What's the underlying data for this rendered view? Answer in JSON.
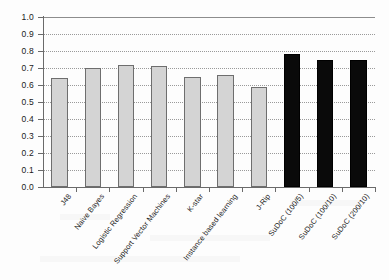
{
  "chart_data": {
    "type": "bar",
    "title": "",
    "subtitle": "",
    "xlabel": "",
    "ylabel": "",
    "categories": [
      "J48",
      "Naive Bayes",
      "Logistic Regression",
      "Support Vector Machines",
      "K-star",
      "Instance based learning",
      "J-Rip",
      "SuDoC (100/5)",
      "SuDoC (100/10)",
      "SuDoC (200/10)"
    ],
    "values": [
      0.64,
      0.7,
      0.72,
      0.71,
      0.65,
      0.66,
      0.59,
      0.78,
      0.75,
      0.75
    ],
    "bar_colors": [
      "#d4d4d4",
      "#d4d4d4",
      "#d4d4d4",
      "#d4d4d4",
      "#d4d4d4",
      "#d4d4d4",
      "#d4d4d4",
      "#0a0a0a",
      "#0a0a0a",
      "#0a0a0a"
    ],
    "ylim": [
      0.0,
      1.0
    ],
    "ytick_labels": [
      "1.0",
      "0.9",
      "0.8",
      "0.7",
      "0.6",
      "0.5",
      "0.4",
      "0.3",
      "0.2",
      "0.1",
      "0.0"
    ],
    "ytick_values": [
      1.0,
      0.9,
      0.8,
      0.7,
      0.6,
      0.5,
      0.4,
      0.3,
      0.2,
      0.1,
      0.0
    ],
    "grid": true,
    "grid_axis": "y",
    "legend": null,
    "legend_position": "none",
    "annotations": []
  },
  "colors": {
    "gray_bar": "#d4d4d4",
    "black_bar": "#0a0a0a",
    "bar_outline": "#6e6e6e",
    "axis": "#6a6a6a",
    "grid": "#9a9a9a",
    "background": "#fdfdfd",
    "text": "#1a1a1a"
  }
}
